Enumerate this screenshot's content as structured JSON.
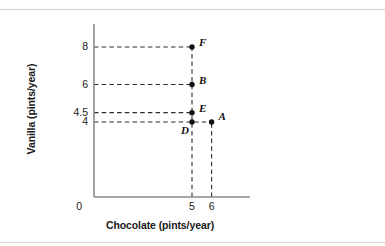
{
  "chart_data": {
    "type": "scatter",
    "title": "",
    "xlabel": "Chocolate (pints/year)",
    "ylabel": "Vanilla (pints/year)",
    "xlim": [
      0,
      7.8
    ],
    "ylim": [
      0,
      9.6
    ],
    "grid": false,
    "legend": "none",
    "origin_label": "0",
    "xticks": [
      {
        "value": 5,
        "label": "5"
      },
      {
        "value": 6,
        "label": "6"
      }
    ],
    "yticks": [
      {
        "value": 4,
        "label": "4"
      },
      {
        "value": 4.5,
        "label": "4.5"
      },
      {
        "value": 6,
        "label": "6"
      },
      {
        "value": 8,
        "label": "8"
      }
    ],
    "points": [
      {
        "name": "F",
        "x": 5,
        "y": 8,
        "label_dx": 7,
        "label_dy": -11
      },
      {
        "name": "B",
        "x": 5,
        "y": 6,
        "label_dx": 7,
        "label_dy": -11
      },
      {
        "name": "E",
        "x": 5,
        "y": 4.5,
        "label_dx": 7,
        "label_dy": -11
      },
      {
        "name": "D",
        "x": 5,
        "y": 4,
        "label_dx": -11,
        "label_dy": 2
      },
      {
        "name": "A",
        "x": 6,
        "y": 4,
        "label_dx": 7,
        "label_dy": -12
      }
    ],
    "guide_lines_horizontal": [
      {
        "y": 8,
        "from_x": 0,
        "to_x": 5
      },
      {
        "y": 6,
        "from_x": 0,
        "to_x": 5
      },
      {
        "y": 4.5,
        "from_x": 0,
        "to_x": 5
      },
      {
        "y": 4,
        "from_x": 0,
        "to_x": 6
      }
    ],
    "guide_lines_vertical": [
      {
        "x": 5,
        "from_y": 0,
        "to_y": 8
      },
      {
        "x": 6,
        "from_y": 0,
        "to_y": 4
      }
    ]
  },
  "colors": {
    "axis": "#8a8a8a",
    "guide": "#2b2b2b",
    "point": "#111111",
    "text": "#1a1a1a",
    "rule": "#d2d2d2",
    "background": "#ffffff"
  }
}
